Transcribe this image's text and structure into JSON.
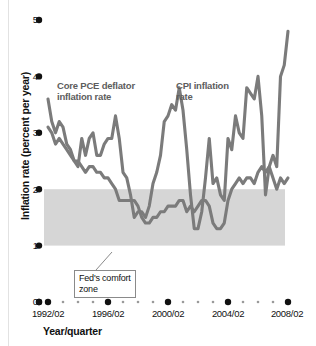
{
  "chart_data": {
    "type": "line",
    "title": "",
    "xlabel": "Year/quarter",
    "ylabel": "Inflation rate (percent per year)",
    "ylim": [
      0,
      5
    ],
    "ytick_labels": [
      "0",
      "1",
      "2",
      "3",
      "4",
      "5"
    ],
    "ytick_values": [
      0,
      1,
      2,
      3,
      4,
      5
    ],
    "xtick_labels": [
      "1992/02",
      "1996/02",
      "2000/02",
      "2004/02",
      "2008/02"
    ],
    "xtick_values": [
      "1992/02",
      "1996/02",
      "2000/02",
      "2004/02",
      "2008/02"
    ],
    "grid": false,
    "legend_position": "inline-annotations",
    "annotations": [
      {
        "name": "core-pce-label",
        "text": "Core PCE deflator\ninflation rate"
      },
      {
        "name": "cpi-label",
        "text": "CPI inflation\nrate"
      },
      {
        "name": "comfort-zone-callout",
        "text": "Fed's comfort\nzone"
      }
    ],
    "bands": [
      {
        "name": "Fed's comfort zone",
        "y0": 1,
        "y1": 2,
        "color": "#d6d6d6"
      }
    ],
    "x": [
      "1992/02",
      "1992/03",
      "1992/04",
      "1993/01",
      "1993/02",
      "1993/03",
      "1993/04",
      "1994/01",
      "1994/02",
      "1994/03",
      "1994/04",
      "1995/01",
      "1995/02",
      "1995/03",
      "1995/04",
      "1996/01",
      "1996/02",
      "1996/03",
      "1996/04",
      "1997/01",
      "1997/02",
      "1997/03",
      "1997/04",
      "1998/01",
      "1998/02",
      "1998/03",
      "1998/04",
      "1999/01",
      "1999/02",
      "1999/03",
      "1999/04",
      "2000/01",
      "2000/02",
      "2000/03",
      "2000/04",
      "2001/01",
      "2001/02",
      "2001/03",
      "2001/04",
      "2002/01",
      "2002/02",
      "2002/03",
      "2002/04",
      "2003/01",
      "2003/02",
      "2003/03",
      "2003/04",
      "2004/01",
      "2004/02",
      "2004/03",
      "2004/04",
      "2005/01",
      "2005/02",
      "2005/03",
      "2005/04",
      "2006/01",
      "2006/02",
      "2006/03",
      "2006/04",
      "2007/01",
      "2007/02",
      "2007/03",
      "2007/04",
      "2008/01",
      "2008/02"
    ],
    "series": [
      {
        "name": "Core PCE deflator inflation rate",
        "color": "#7b7b7b",
        "values": [
          3.1,
          3.0,
          2.8,
          2.9,
          2.8,
          2.7,
          2.6,
          2.5,
          2.5,
          2.4,
          2.3,
          2.4,
          2.4,
          2.3,
          2.3,
          2.2,
          2.2,
          2.1,
          2.0,
          1.8,
          1.8,
          1.8,
          1.8,
          1.8,
          1.7,
          1.5,
          1.4,
          1.4,
          1.5,
          1.5,
          1.6,
          1.6,
          1.7,
          1.7,
          1.7,
          1.8,
          1.8,
          1.6,
          1.7,
          1.6,
          1.7,
          1.8,
          1.8,
          1.7,
          1.4,
          1.3,
          1.3,
          1.4,
          1.8,
          2.0,
          2.1,
          2.2,
          2.1,
          2.2,
          2.2,
          2.1,
          2.3,
          2.4,
          2.3,
          2.4,
          2.2,
          2.0,
          2.2,
          2.1,
          2.2
        ]
      },
      {
        "name": "CPI inflation rate",
        "color": "#7b7b7b",
        "values": [
          3.6,
          3.2,
          3.0,
          3.2,
          3.1,
          2.8,
          2.7,
          2.5,
          2.4,
          2.9,
          2.6,
          2.9,
          3.0,
          2.6,
          2.6,
          2.8,
          2.9,
          2.9,
          3.3,
          2.9,
          2.3,
          2.2,
          1.9,
          1.5,
          1.6,
          1.6,
          1.5,
          1.7,
          2.1,
          2.3,
          2.6,
          3.2,
          3.3,
          3.5,
          3.4,
          3.8,
          3.4,
          2.7,
          1.9,
          1.3,
          1.3,
          1.6,
          2.2,
          2.9,
          2.1,
          2.2,
          1.9,
          1.8,
          2.9,
          2.7,
          3.3,
          3.0,
          2.9,
          3.8,
          3.7,
          3.6,
          4.0,
          3.3,
          1.9,
          2.4,
          2.6,
          2.4,
          4.0,
          4.2,
          4.8
        ]
      }
    ]
  },
  "page": {
    "y_axis_title": "Inflation rate (percent per year)",
    "x_axis_title": "Year/quarter",
    "label_core_pce": "Core PCE deflator\ninflation rate",
    "label_cpi": "CPI inflation\nrate",
    "callout_comfort_zone": "Fed's comfort\nzone",
    "ytick_0": "0",
    "ytick_1": "1",
    "ytick_2": "2",
    "ytick_3": "3",
    "ytick_4": "4",
    "ytick_5": "5",
    "xtick_0": "1992/02",
    "xtick_1": "1996/02",
    "xtick_2": "2000/02",
    "xtick_3": "2004/02",
    "xtick_4": "2008/02"
  }
}
